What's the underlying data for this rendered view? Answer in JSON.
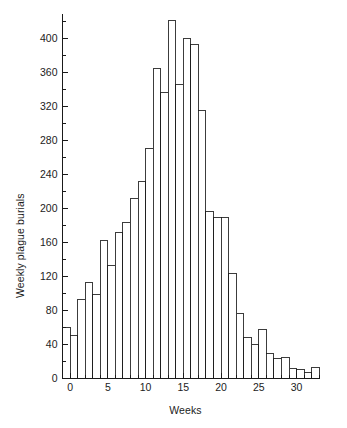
{
  "chart_data": {
    "type": "bar",
    "title": "",
    "subtitle": "",
    "xlabel": "Weeks",
    "ylabel": "Weekly plague burials",
    "grid": false,
    "legend": null,
    "bar_style": "histogram-outline",
    "bar_fill": "#ffffff",
    "bar_stroke": "#1a1a1a",
    "axis_color": "#1a1a1a",
    "xlim": [
      -1,
      33
    ],
    "ylim": [
      0,
      430
    ],
    "xticks_major": [
      0,
      5,
      10,
      15,
      20,
      25,
      30
    ],
    "xticks_major_labels": [
      "0",
      "5",
      "10",
      "15",
      "20",
      "25",
      "30"
    ],
    "xtick_minor_step": 1,
    "yticks_major": [
      0,
      40,
      80,
      120,
      160,
      200,
      240,
      280,
      320,
      360,
      400
    ],
    "yticks_major_labels": [
      "0",
      "40",
      "80",
      "120",
      "160",
      "200",
      "240",
      "280",
      "320",
      "360",
      "400"
    ],
    "ytick_minor_step": 20,
    "categories": [
      "-1",
      "0",
      "1",
      "2",
      "3",
      "4",
      "5",
      "6",
      "7",
      "8",
      "9",
      "10",
      "11",
      "12",
      "13",
      "14",
      "15",
      "16",
      "17",
      "18",
      "19",
      "20",
      "21",
      "22",
      "23",
      "24",
      "25",
      "26",
      "27",
      "28",
      "29",
      "30",
      "31",
      "32"
    ],
    "values": [
      60,
      50,
      93,
      113,
      99,
      162,
      133,
      172,
      184,
      212,
      232,
      270,
      364,
      336,
      421,
      346,
      400,
      393,
      315,
      196,
      189,
      189,
      123,
      77,
      48,
      40,
      58,
      29,
      24,
      25,
      12,
      11,
      7,
      13
    ],
    "x": [
      -1,
      0,
      1,
      2,
      3,
      4,
      5,
      6,
      7,
      8,
      9,
      10,
      11,
      12,
      13,
      14,
      15,
      16,
      17,
      18,
      19,
      20,
      21,
      22,
      23,
      24,
      25,
      26,
      27,
      28,
      29,
      30,
      31,
      32
    ],
    "bar_width": 1,
    "n_bars": 34,
    "max_value": 421,
    "max_value_at_week": "13",
    "annotations": []
  },
  "axes": {
    "x_axis_name": "weeks-axis",
    "y_axis_name": "burials-axis"
  }
}
